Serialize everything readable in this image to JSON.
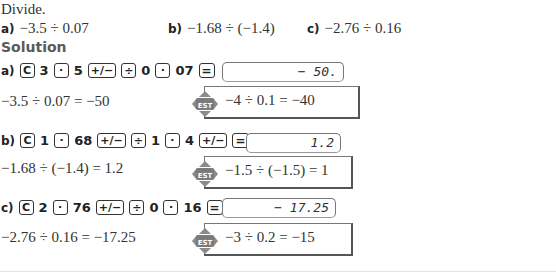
{
  "instruction": "Divide.",
  "problems": [
    {
      "label": "a)",
      "expression": "−3.5 ÷ 0.07"
    },
    {
      "label": "b)",
      "expression": "−1.68 ÷ (−1.4)"
    },
    {
      "label": "c)",
      "expression": "−2.76 ÷ 0.16"
    }
  ],
  "solution_heading": "Solution",
  "parts": [
    {
      "label": "a)",
      "keys": [
        "C",
        "3",
        "·",
        "5",
        "+/−",
        "÷",
        "0",
        "·",
        "07",
        "="
      ],
      "display": "− 50.",
      "result": "−3.5 ÷ 0.07 = −50",
      "estimate": "−4 ÷ 0.1 = −40"
    },
    {
      "label": "b)",
      "keys": [
        "C",
        "1",
        "·",
        "68",
        "+/−",
        "÷",
        "1",
        "·",
        "4",
        "+/−",
        "="
      ],
      "display": "1.2",
      "result": "−1.68 ÷ (−1.4) = 1.2",
      "estimate": "−1.5 ÷ (−1.5) = 1"
    },
    {
      "label": "c)",
      "keys": [
        "C",
        "2",
        "·",
        "76",
        "+/−",
        "÷",
        "0",
        "·",
        "16",
        "="
      ],
      "display": "− 17.25",
      "result": "−2.76 ÷ 0.16 = −17.25",
      "estimate": "−3 ÷ 0.2 = −15"
    }
  ],
  "est_icon_label": "EST",
  "colors": {
    "text": "#333333",
    "heading": "#5a5a5a",
    "icon": "#8a8a8a"
  }
}
